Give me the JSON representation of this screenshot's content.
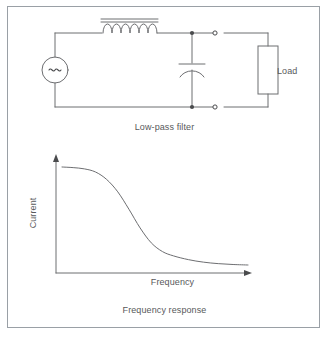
{
  "figure": {
    "width": 329,
    "height": 337,
    "background": "#ffffff",
    "border_color": "#9aa0a6",
    "line_color": "#6d6e71",
    "text_color": "#58595b"
  },
  "circuit": {
    "caption": "Low-pass filter",
    "components": {
      "source": {
        "name": "ac-voltage-source",
        "symbol": "~"
      },
      "inductor": {
        "name": "inductor",
        "coil_turns": 6,
        "core_lines": 2
      },
      "capacitor": {
        "name": "capacitor",
        "style": "polarized"
      },
      "load": {
        "name": "load-resistor",
        "label": "Load"
      },
      "terminals": {
        "filled_count": 2,
        "open_count": 2
      }
    }
  },
  "chart_data": {
    "type": "line",
    "title": "Frequency response",
    "xlabel": "Frequency",
    "ylabel": "Current",
    "grid": false,
    "legend": null,
    "xlim": [
      0,
      1
    ],
    "ylim": [
      0,
      1
    ],
    "tick_labels": {
      "x": [],
      "y": []
    },
    "axis_arrows": {
      "x": true,
      "y": true
    },
    "series": [
      {
        "name": "current-vs-frequency",
        "description": "Low-pass filter response: high current at low frequency, rolling off to a low plateau at high frequency",
        "x": [
          0.0,
          0.06,
          0.12,
          0.18,
          0.24,
          0.3,
          0.36,
          0.42,
          0.48,
          0.54,
          0.6,
          0.68,
          0.76,
          0.84,
          0.92,
          1.0
        ],
        "y": [
          0.96,
          0.955,
          0.945,
          0.92,
          0.86,
          0.76,
          0.62,
          0.47,
          0.35,
          0.28,
          0.245,
          0.215,
          0.195,
          0.183,
          0.176,
          0.172
        ]
      }
    ]
  }
}
